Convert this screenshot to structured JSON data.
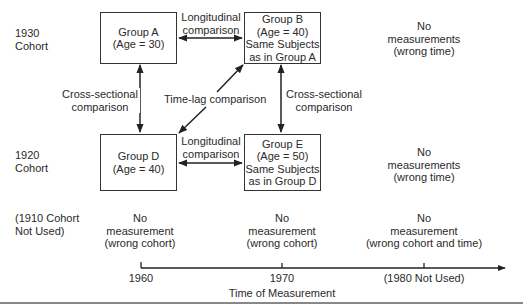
{
  "rows": [
    {
      "line1": "1930",
      "line2": "Cohort"
    },
    {
      "line1": "1920",
      "line2": "Cohort"
    },
    {
      "line1": "(1910 Cohort",
      "line2": "Not Used)"
    }
  ],
  "boxes": {
    "a": {
      "line1": "Group A",
      "line2": "(Age  =  30)"
    },
    "b": {
      "line1": "Group B",
      "line2": "(Age  =  40)",
      "line3": "Same Subjects",
      "line4": "as in Group A"
    },
    "d": {
      "line1": "Group D",
      "line2": "(Age = 40)"
    },
    "e": {
      "line1": "Group E",
      "line2": "(Age = 50)",
      "line3": "Same Subjects",
      "line4": "as in Group D"
    }
  },
  "comparisons": {
    "long_top": {
      "line1": "Longitudinal",
      "line2": "comparison"
    },
    "long_bottom": {
      "line1": "Longitudinal",
      "line2": "comparison"
    },
    "cross_left": {
      "line1": "Cross-sectional",
      "line2": "comparison"
    },
    "cross_right": {
      "line1": "Cross-sectional",
      "line2": "comparison"
    },
    "timelag": "Time-lag comparison"
  },
  "no_measure": {
    "r1c3": {
      "line1": "No",
      "line2": "measurements",
      "line3": "(wrong time)"
    },
    "r2c3": {
      "line1": "No",
      "line2": "measurements",
      "line3": "(wrong time)"
    },
    "r3c1": {
      "line1": "No",
      "line2": "measurement",
      "line3": "(wrong cohort)"
    },
    "r3c2": {
      "line1": "No",
      "line2": "measurement",
      "line3": "(wrong cohort)"
    },
    "r3c3": {
      "line1": "No",
      "line2": "measurement",
      "line3": "(wrong cohort and time)"
    }
  },
  "axis": {
    "ticks": [
      "1960",
      "1970",
      "(1980 Not Used)"
    ],
    "title": "Time of Measurement"
  }
}
